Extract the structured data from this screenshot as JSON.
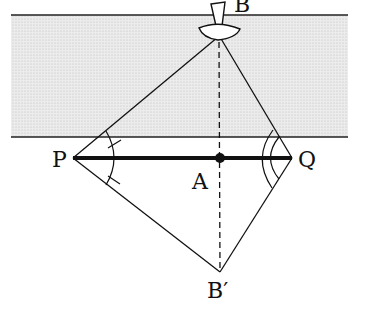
{
  "diagram": {
    "labels": {
      "B": "B",
      "P": "P",
      "Q": "Q",
      "A": "A",
      "B_prime": "B′"
    },
    "points": {
      "B_marker": [
        218,
        30
      ],
      "P": [
        73,
        158
      ],
      "Q": [
        292,
        158
      ],
      "A": [
        220,
        158
      ],
      "B_prime": [
        220,
        272
      ]
    },
    "river": {
      "top_y": 15,
      "bottom_y": 137,
      "left_x": 11,
      "right_x": 348,
      "fill": "#e6e6e6"
    },
    "colors": {
      "line": "#111111",
      "river_fill": "#e6e6e6"
    }
  }
}
